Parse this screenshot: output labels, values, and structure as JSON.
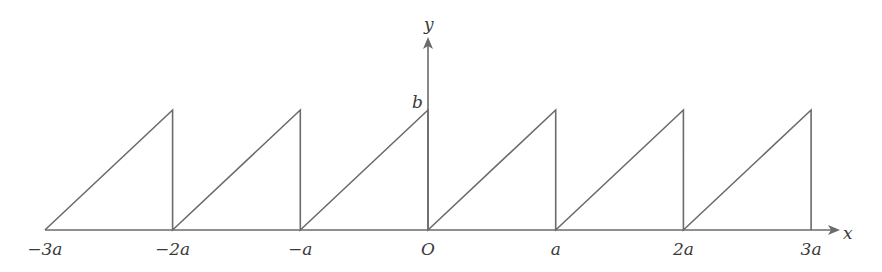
{
  "figure": {
    "type": "sawtooth-wave",
    "axis_labels": {
      "x": "x",
      "y": "y"
    },
    "origin_label": "O",
    "amplitude_label": "b",
    "x_ticks": [
      "−3a",
      "−2a",
      "−a",
      "O",
      "a",
      "2a",
      "3a"
    ],
    "stroke_color": "#6b6b6b"
  },
  "chart_data": {
    "type": "line",
    "title": "",
    "xlabel": "x",
    "ylabel": "y",
    "categories": [
      "-3a",
      "-2a",
      "-a",
      "O",
      "a",
      "2a",
      "3a"
    ],
    "series": [
      {
        "name": "sawtooth f(x)",
        "x": [
          -3,
          -2,
          -2,
          -1,
          -1,
          0,
          0,
          1,
          1,
          2,
          2,
          3,
          3
        ],
        "values": [
          0,
          1,
          0,
          1,
          0,
          1,
          0,
          1,
          0,
          1,
          0,
          1,
          0
        ]
      }
    ],
    "annotations": [
      "b (peak height)",
      "O (origin)"
    ],
    "xlim": [
      -3,
      3
    ],
    "ylim": [
      0,
      1
    ],
    "grid": false
  }
}
